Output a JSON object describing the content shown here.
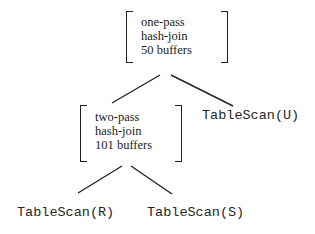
{
  "diagram": {
    "root_node": {
      "lines": [
        "one-pass",
        "hash-join",
        "50 buffers"
      ]
    },
    "left_node": {
      "lines": [
        "two-pass",
        "hash-join",
        "101 buffers"
      ]
    },
    "right_leaf": {
      "label": "TableScan(U)"
    },
    "bottom_left_leaf": {
      "label": "TableScan(R)"
    },
    "bottom_right_leaf": {
      "label": "TableScan(S)"
    },
    "colors": {
      "background": "#ffffff",
      "ink": "#1f1f1f"
    }
  }
}
